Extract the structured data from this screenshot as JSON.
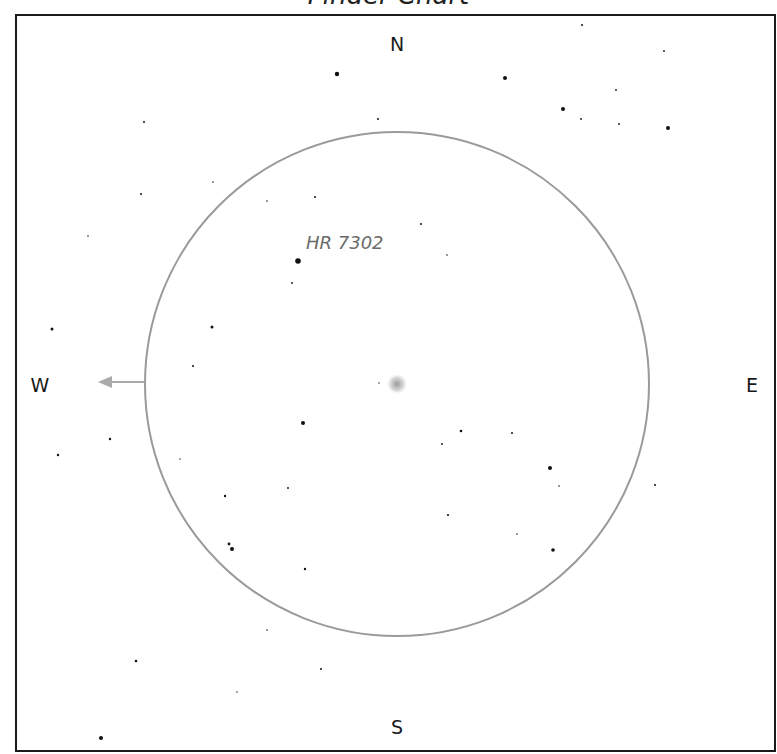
{
  "title": "Finder Chart",
  "compass": {
    "north": "N",
    "south": "S",
    "east": "E",
    "west": "W"
  },
  "field_of_view": {
    "center": [
      397,
      384
    ],
    "radius": 252,
    "color": "#9a9a9a"
  },
  "target": {
    "position": [
      397,
      384
    ],
    "label": ""
  },
  "labeled_star": {
    "name": "HR 7302",
    "position": [
      298,
      261
    ]
  },
  "motion_arrow": {
    "direction": "west",
    "from": [
      145,
      382
    ],
    "to": [
      98,
      382
    ],
    "color": "#aaaaaa"
  },
  "stars": [
    [
      337,
      74,
      2.2
    ],
    [
      144,
      122,
      1
    ],
    [
      378,
      119,
      1
    ],
    [
      213,
      182,
      0.8
    ],
    [
      141,
      194,
      1
    ],
    [
      267,
      201,
      0.8
    ],
    [
      315,
      197,
      1
    ],
    [
      582,
      25,
      1
    ],
    [
      664,
      51,
      0.9
    ],
    [
      505,
      78,
      2
    ],
    [
      616,
      90,
      0.9
    ],
    [
      563,
      109,
      2
    ],
    [
      581,
      119,
      0.9
    ],
    [
      619,
      124,
      0.9
    ],
    [
      668,
      128,
      2
    ],
    [
      88,
      236,
      0.8
    ],
    [
      298,
      261,
      2.8
    ],
    [
      292,
      283,
      0.9
    ],
    [
      52,
      329,
      1.5
    ],
    [
      212,
      327,
      1.5
    ],
    [
      193,
      366,
      1
    ],
    [
      379,
      383,
      0.7
    ],
    [
      421,
      224,
      1
    ],
    [
      447,
      255,
      0.8
    ],
    [
      303,
      423,
      2
    ],
    [
      110,
      439,
      1.2
    ],
    [
      58,
      455,
      1.2
    ],
    [
      180,
      459,
      0.7
    ],
    [
      225,
      496,
      1.2
    ],
    [
      288,
      488,
      0.9
    ],
    [
      229,
      544,
      1.4
    ],
    [
      232,
      549,
      2
    ],
    [
      305,
      569,
      1.2
    ],
    [
      461,
      431,
      1.3
    ],
    [
      512,
      433,
      1
    ],
    [
      442,
      444,
      0.9
    ],
    [
      550,
      468,
      2
    ],
    [
      559,
      486,
      0.8
    ],
    [
      655,
      485,
      1
    ],
    [
      448,
      515,
      1.1
    ],
    [
      517,
      534,
      0.8
    ],
    [
      553,
      550,
      1.8
    ],
    [
      267,
      630,
      0.8
    ],
    [
      136,
      661,
      1.3
    ],
    [
      321,
      669,
      1
    ],
    [
      237,
      692,
      0.7
    ],
    [
      101,
      738,
      2
    ]
  ]
}
